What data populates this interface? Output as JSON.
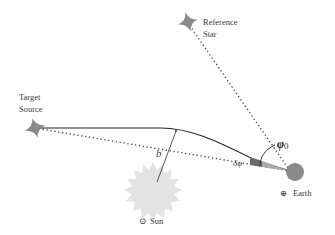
{
  "diagram": {
    "labels": {
      "reference_star_line1": "Reference",
      "reference_star_line2": "Star",
      "target_source_line1": "Target",
      "target_source_line2": "Source",
      "earth": "Earth",
      "earth_symbol": "⊕",
      "sun": "Sun",
      "sun_symbol": "⊙",
      "impact_parameter": "b",
      "deflection_angle": "δφ",
      "angle_phi": "φ",
      "angle_phi_subscript": "0"
    },
    "colors": {
      "background": "#ffffff",
      "star": "#8a8a8a",
      "sun": "#e3e3e3",
      "earth": "#8a8a8a",
      "deflection_wedge_dark": "#6a6a6a",
      "deflection_wedge_light": "#b0b0b0",
      "lines": "#333333",
      "text": "#3a3a3a"
    }
  }
}
